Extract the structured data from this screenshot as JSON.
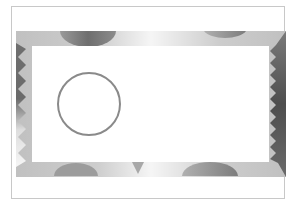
{
  "figure": {
    "colors": {
      "frame_border": "#c8c8c8",
      "band_base": "#ececec",
      "halftone_dot": "#bdbdbd",
      "disc_dark": "#7a7a7a",
      "edge_dark": "#555555",
      "circle_stroke": "#8a8a8a",
      "inner_fill": "#ffffff"
    },
    "shapes": {
      "top_discs": 2,
      "bottom_discs": 2,
      "bottom_notch": "triangle",
      "left_edge": "zigzag",
      "right_edge": "zigzag",
      "circle": "outline"
    }
  }
}
